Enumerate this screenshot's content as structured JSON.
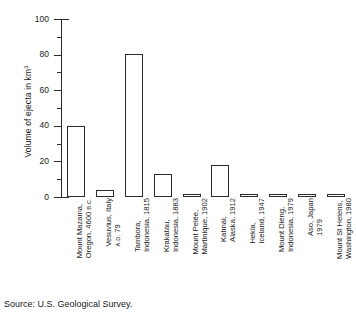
{
  "chart_data": {
    "type": "bar",
    "title": "",
    "xlabel": "",
    "ylabel": "Volume of ejecta in km",
    "ylabel_exponent": "3",
    "ylim": [
      0,
      100
    ],
    "ytick_labels": [
      "0",
      "20",
      "40",
      "60",
      "80",
      "100"
    ],
    "ytick_values": [
      0,
      20,
      40,
      60,
      80,
      100
    ],
    "yminor_values": [
      10,
      30,
      50,
      70,
      90
    ],
    "grid": false,
    "legend": false,
    "categories": [
      "Mount Mazama, Oregon, 4600 B.C.",
      "Vesuvius, Italy A.D. 79",
      "Tambora, Indonesia, 1815",
      "Krakatau, Indonesia, 1883",
      "Mount Pelée, Martinique, 1902",
      "Katmai, Alaska, 1912",
      "Hekla, Iceland, 1947",
      "Mount Dieng, Indonesia, 1979",
      "Aso, Japan 1979",
      "Mount St Helens, Washington, 1980"
    ],
    "values": [
      40,
      4,
      80.5,
      13,
      1,
      18,
      0.5,
      0.9,
      0.4,
      0.8
    ],
    "source": "Source: U.S. Geological Survey."
  },
  "labels": [
    {
      "line1": "Mount Mazama,",
      "line2": "Oregon, 4600 ",
      "small2": "B.C."
    },
    {
      "line1": "Vesuvius, Italy",
      "line2": "",
      "small1pre": "",
      "small2": "A.D.",
      "line2post": " 79"
    },
    {
      "line1": "Tambora,",
      "line2": "Indonesia, 1815",
      "small2": ""
    },
    {
      "line1": "Krakatau,",
      "line2": "Indonesia, 1883",
      "small2": ""
    },
    {
      "line1": "Mount Pelée,",
      "line2": "Martinique, 1902",
      "small2": ""
    },
    {
      "line1": "Katmai,",
      "line2": "Alaska, 1912",
      "small2": ""
    },
    {
      "line1": "Hekla,",
      "line2": "Iceland, 1947",
      "small2": ""
    },
    {
      "line1": "Mount Dieng,",
      "line2": "Indonesia, 1979",
      "small2": ""
    },
    {
      "line1": "Aso, Japan",
      "line2": "1979",
      "small2": ""
    },
    {
      "line1": "Mount St Helens,",
      "line2": "Washington, 1980",
      "small2": ""
    }
  ],
  "axis": {
    "y_title_main": "Volume of ejecta in km",
    "y_title_sup": "3"
  },
  "footer": {
    "source": "Source: U.S. Geological Survey."
  },
  "colors": {
    "ink": "#2b2b2b",
    "background": "#ffffff",
    "bar_fill": "#ffffff"
  }
}
